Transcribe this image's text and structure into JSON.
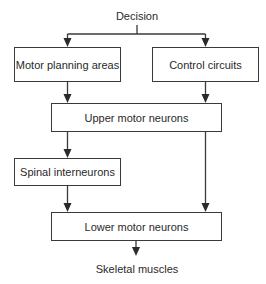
{
  "diagram": {
    "type": "flowchart",
    "colors": {
      "line": "#3a3a3a",
      "text": "#2a2a2a",
      "background": "#ffffff"
    },
    "top_label": "Decision",
    "bottom_label": "Skeletal muscles",
    "nodes": {
      "motor_planning": "Motor planning areas",
      "control_circuits": "Control circuits",
      "upper_motor": "Upper motor neurons",
      "spinal_interneurons": "Spinal interneurons",
      "lower_motor": "Lower motor neurons"
    },
    "edges": [
      {
        "from": "Decision",
        "to": "Motor planning areas"
      },
      {
        "from": "Decision",
        "to": "Control circuits"
      },
      {
        "from": "Motor planning areas",
        "to": "Upper motor neurons"
      },
      {
        "from": "Control circuits",
        "to": "Upper motor neurons"
      },
      {
        "from": "Upper motor neurons",
        "to": "Spinal interneurons"
      },
      {
        "from": "Upper motor neurons",
        "to": "Lower motor neurons"
      },
      {
        "from": "Spinal interneurons",
        "to": "Lower motor neurons"
      },
      {
        "from": "Lower motor neurons",
        "to": "Skeletal muscles"
      }
    ]
  }
}
